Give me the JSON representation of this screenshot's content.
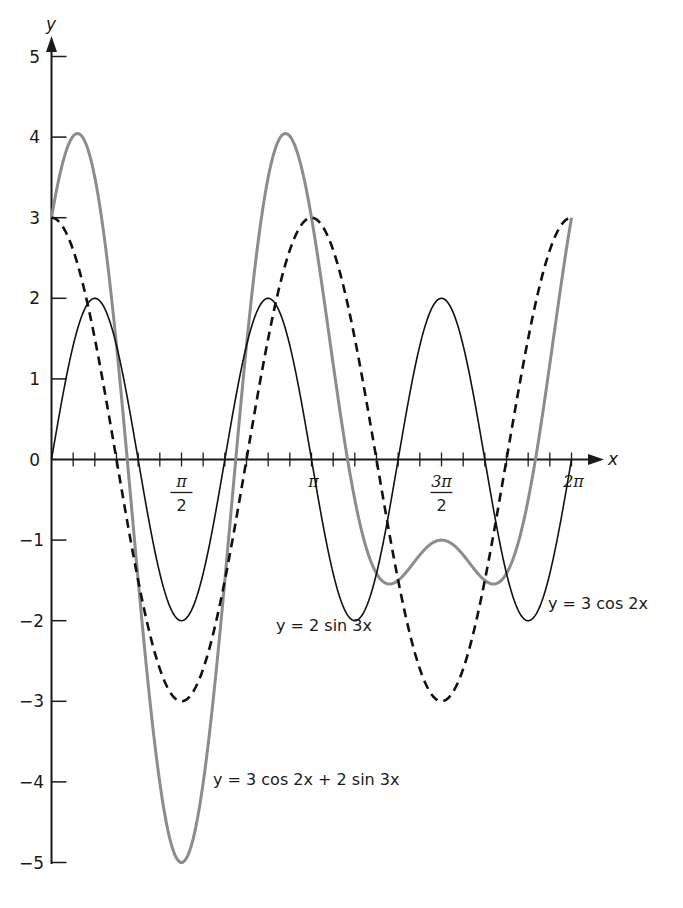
{
  "chart_data": {
    "type": "line",
    "title": "",
    "xlabel": "x",
    "ylabel": "y",
    "xlim": [
      0,
      6.2832
    ],
    "ylim": [
      -5,
      5
    ],
    "grid": false,
    "legend": "inline labels next to curves",
    "x_tick_labels": [
      "π/2",
      "π",
      "3π/2",
      "2π"
    ],
    "x_tick_positions": [
      1.5708,
      3.1416,
      4.7124,
      6.2832
    ],
    "x_minor_tick_step": "π/12",
    "y_tick_labels": [
      "5",
      "4",
      "3",
      "2",
      "1",
      "0",
      "-1",
      "-2",
      "-3",
      "-4",
      "-5"
    ],
    "y_tick_positions": [
      5,
      4,
      3,
      2,
      1,
      0,
      -1,
      -2,
      -3,
      -4,
      -5
    ],
    "x_values_note": "x = k·π/12, k = 0..24",
    "x": [
      0,
      0.2618,
      0.5236,
      0.7854,
      1.0472,
      1.309,
      1.5708,
      1.8326,
      2.0944,
      2.3562,
      2.618,
      2.8798,
      3.1416,
      3.4034,
      3.6652,
      3.927,
      4.1888,
      4.4506,
      4.7124,
      4.9742,
      5.236,
      5.4978,
      5.7596,
      6.0214,
      6.2832
    ],
    "series": [
      {
        "name": "y = 3 cos 2x",
        "style": "dashed",
        "color": "#111111",
        "values": [
          3,
          2.598,
          1.5,
          0,
          -1.5,
          -2.598,
          -3,
          -2.598,
          -1.5,
          0,
          1.5,
          2.598,
          3,
          2.598,
          1.5,
          0,
          -1.5,
          -2.598,
          -3,
          -2.598,
          -1.5,
          0,
          1.5,
          2.598,
          3
        ]
      },
      {
        "name": "y = 2 sin 3x",
        "style": "solid-thin",
        "color": "#111111",
        "values": [
          0,
          1.414,
          2,
          1.414,
          0,
          -1.414,
          -2,
          -1.414,
          0,
          1.414,
          2,
          1.414,
          0,
          -1.414,
          -2,
          -1.414,
          0,
          1.414,
          2,
          1.414,
          0,
          -1.414,
          -2,
          -1.414,
          0
        ]
      },
      {
        "name": "y = 3 cos 2x + 2 sin 3x",
        "style": "solid-thick",
        "color": "#8c8c8c",
        "values": [
          3,
          4.012,
          3.5,
          1.414,
          -1.5,
          -4.012,
          -5,
          -4.012,
          -1.5,
          1.414,
          3.5,
          4.012,
          3,
          1.184,
          -0.5,
          -1.414,
          -1.5,
          -1.184,
          -1,
          -1.184,
          -1.5,
          -1.414,
          -0.5,
          1.184,
          3
        ]
      }
    ],
    "annotations": [
      {
        "text": "y = 2 sin 3x",
        "near_x": 3.0,
        "near_y": -2.2
      },
      {
        "text": "y = 3 cos 2x",
        "near_x": 6.0,
        "near_y": -1.8
      },
      {
        "text": "y = 3 cos 2x + 2 sin 3x",
        "near_x": 2.0,
        "near_y": -4.1
      }
    ]
  },
  "axes": {
    "x_var": "x",
    "y_var": "y",
    "pi": "π",
    "x_ticks": [
      {
        "num": "π",
        "den": "2",
        "kind": "fraction"
      },
      {
        "num": "π",
        "den": "",
        "kind": "single"
      },
      {
        "num": "3π",
        "den": "2",
        "kind": "fraction"
      },
      {
        "num": "2π",
        "den": "",
        "kind": "single"
      }
    ],
    "y_ticks": [
      "5",
      "4",
      "3",
      "2",
      "1",
      "0",
      "−1",
      "−2",
      "−3",
      "−4",
      "−5"
    ]
  },
  "labels": {
    "sin_curve": "y = 2 sin 3x",
    "cos_curve": "y = 3 cos 2x",
    "sum_curve": "y = 3 cos 2x + 2 sin 3x"
  },
  "colors": {
    "axis": "#1a1a1a",
    "cos_curve": "#111111",
    "sin_curve": "#111111",
    "sum_curve": "#8c8c8c"
  }
}
